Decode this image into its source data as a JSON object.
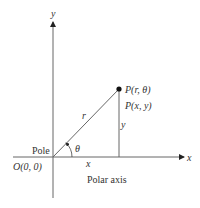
{
  "diagram": {
    "axes": {
      "x_label": "x",
      "y_label": "y"
    },
    "point": {
      "polar_label": "P(r, θ)",
      "cartesian_label": "P(x, y)"
    },
    "segment_labels": {
      "radius": "r",
      "vertical": "y",
      "horizontal": "x",
      "angle": "θ"
    },
    "origin": {
      "pole_label": "Pole",
      "origin_label": "O(0, 0)"
    },
    "polar_axis_label": "Polar axis",
    "colors": {
      "line": "#555555",
      "text": "#333333",
      "point": "#111111"
    }
  }
}
